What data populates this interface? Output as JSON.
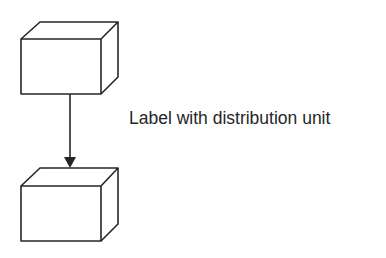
{
  "diagram": {
    "nodes": [
      {
        "id": "box-top",
        "shape": "cube"
      },
      {
        "id": "box-bottom",
        "shape": "cube"
      }
    ],
    "edge": {
      "from": "box-top",
      "to": "box-bottom",
      "arrow": "filled-triangle"
    },
    "label": "Label with distribution unit",
    "colors": {
      "stroke": "#262626",
      "background": "#ffffff"
    }
  }
}
